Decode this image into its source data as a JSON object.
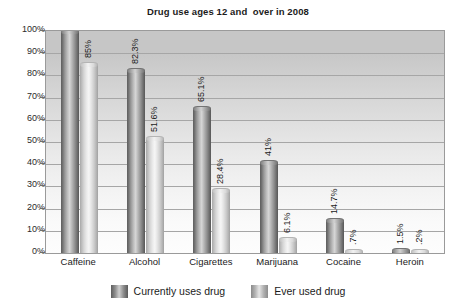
{
  "chart_data": {
    "type": "bar",
    "title": "Drug use ages 12 and  over in 2008",
    "xlabel": "",
    "ylabel": "",
    "ylim": [
      0,
      100
    ],
    "grid": true,
    "legend_position": "bottom",
    "categories": [
      "Caffeine",
      "Alcohol",
      "Cigarettes",
      "Marijuana",
      "Cocaine",
      "Heroin"
    ],
    "ytick_labels": [
      "100%",
      "90%",
      "80%",
      "70%",
      "60%",
      "50%",
      "40%",
      "30%",
      "20%",
      "10%",
      "0%"
    ],
    "ytick_values": [
      100,
      90,
      80,
      70,
      60,
      50,
      40,
      30,
      20,
      10,
      0
    ],
    "series": [
      {
        "name": "Currently uses drug",
        "color": "#6f6f6f",
        "values": [
          100,
          82.3,
          65.1,
          41,
          14.7,
          1.5
        ],
        "labels": [
          "",
          "82.3%",
          "65.1%",
          "41%",
          "14.7%",
          "1.5%"
        ]
      },
      {
        "name": "Ever used drug",
        "color": "#cfcfcf",
        "values": [
          85,
          51.6,
          28.4,
          6.1,
          0.7,
          0.2
        ],
        "labels": [
          "85%",
          "51.6%",
          "28.4%",
          "6.1%",
          ".7%",
          ".2%"
        ]
      }
    ]
  },
  "legend": {
    "entries": [
      {
        "label": "Currently uses drug",
        "swatch": "dark"
      },
      {
        "label": "Ever used drug",
        "swatch": "light"
      }
    ]
  }
}
